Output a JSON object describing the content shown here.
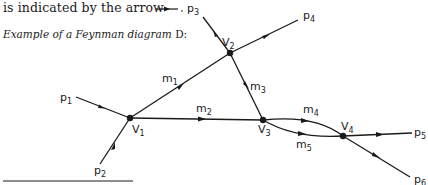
{
  "intro_text": "is indicated by the arrow",
  "caption": {
    "text": "Example of a Feynman diagram ",
    "symbol": "D:"
  },
  "vertices": [
    {
      "id": "V1",
      "label": "V",
      "sub": "1"
    },
    {
      "id": "V2",
      "label": "V",
      "sub": "2"
    },
    {
      "id": "V3",
      "label": "V",
      "sub": "3"
    },
    {
      "id": "V4",
      "label": "V",
      "sub": "4"
    }
  ],
  "external_lines": [
    {
      "label": "p",
      "sub": "1",
      "from": "p1",
      "to": "V1"
    },
    {
      "label": "p",
      "sub": "2",
      "from": "p2",
      "to": "V1"
    },
    {
      "label": "p",
      "sub": "3",
      "from": "p3",
      "to": "V2"
    },
    {
      "label": "p",
      "sub": "4",
      "from": "V2",
      "to": "p4"
    },
    {
      "label": "p",
      "sub": "5",
      "from": "V4",
      "to": "p5"
    },
    {
      "label": "p",
      "sub": "6",
      "from": "V4",
      "to": "p6"
    }
  ],
  "internal_lines": [
    {
      "label": "m",
      "sub": "1",
      "from": "V1",
      "to": "V2"
    },
    {
      "label": "m",
      "sub": "2",
      "from": "V1",
      "to": "V3"
    },
    {
      "label": "m",
      "sub": "3",
      "from": "V2",
      "to": "V3"
    },
    {
      "label": "m",
      "sub": "4",
      "from": "V3",
      "to": "V4"
    },
    {
      "label": "m",
      "sub": "5",
      "from": "V3",
      "to": "V4"
    }
  ],
  "colors": {
    "ink": "#1a1a1a",
    "background": "#ffffff"
  }
}
